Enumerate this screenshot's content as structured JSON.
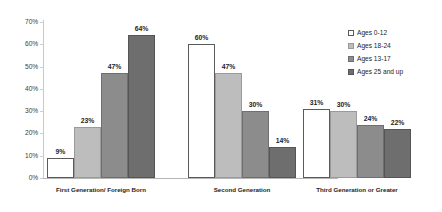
{
  "chart_data": {
    "type": "bar",
    "title": "",
    "xlabel": "",
    "ylabel": "",
    "ylim": [
      0,
      70
    ],
    "ytick_labels": [
      "0%",
      "10%",
      "20%",
      "30%",
      "40%",
      "50%",
      "60%",
      "70%"
    ],
    "ytick_values": [
      0,
      10,
      20,
      30,
      40,
      50,
      60,
      70
    ],
    "grid": false,
    "legend_position": "right",
    "categories": [
      "First Generation/ Foreign Born",
      "Second Generation",
      "Third Generation or Greater"
    ],
    "series": [
      {
        "name": "Ages 0-12",
        "color": "#ffffff",
        "values": [
          9,
          60,
          31
        ],
        "labels": [
          "9%",
          "60%",
          "31%"
        ]
      },
      {
        "name": "Ages 18-24",
        "color": "#bdbdbd",
        "values": [
          23,
          47,
          30
        ],
        "labels": [
          "23%",
          "47%",
          "30%"
        ]
      },
      {
        "name": "Ages 13-17",
        "color": "#8c8c8c",
        "values": [
          47,
          30,
          24
        ],
        "labels": [
          "47%",
          "30%",
          "24%"
        ]
      },
      {
        "name": "Ages 25 and up",
        "color": "#6e6e6e",
        "values": [
          64,
          14,
          22
        ],
        "labels": [
          "64%",
          "14%",
          "22%"
        ]
      }
    ]
  },
  "axis": {
    "ticks": [
      {
        "label": "70%",
        "value": 70
      },
      {
        "label": "60%",
        "value": 60
      },
      {
        "label": "50%",
        "value": 50
      },
      {
        "label": "40%",
        "value": 40
      },
      {
        "label": "30%",
        "value": 30
      },
      {
        "label": "20%",
        "value": 20
      },
      {
        "label": "10%",
        "value": 10
      },
      {
        "label": "0%",
        "value": 0
      }
    ]
  },
  "legend": {
    "items": [
      {
        "label": "Ages 0-12",
        "swatch": "s0"
      },
      {
        "label": "Ages 18-24",
        "swatch": "s1"
      },
      {
        "label": "Ages 13-17",
        "swatch": "s2"
      },
      {
        "label": "Ages 25 and up",
        "swatch": "s3"
      }
    ]
  }
}
